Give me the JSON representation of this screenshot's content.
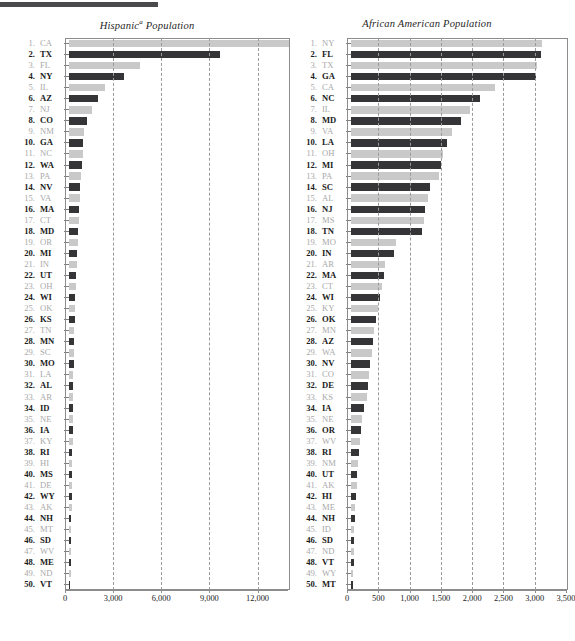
{
  "document": {
    "top_rule_color": "#4a4a4c"
  },
  "colors": {
    "bar_dark": "#353537",
    "bar_light": "#c9c9c9",
    "label_dark": "#1b1b1b",
    "label_light": "#a9a9a9",
    "gridline": "#9a9a9a",
    "frame": "#8c8c8c"
  },
  "chart_data": [
    {
      "id": "hispanic",
      "type": "bar",
      "orientation": "horizontal",
      "title": "Hispanic* Population",
      "title_main": "Hispanic",
      "title_sup": "a",
      "title_tail": " Population",
      "xlabel": "",
      "ylabel": "",
      "xlim": [
        0,
        13900
      ],
      "grid": true,
      "legend": "none",
      "ticks": [
        0,
        3000,
        6000,
        9000,
        12000
      ],
      "tick_labels": [
        "0",
        "3,000",
        "6,000",
        "9,000",
        "12,000"
      ],
      "categories": [
        "CA",
        "TX",
        "FL",
        "NY",
        "IL",
        "AZ",
        "NJ",
        "CO",
        "NM",
        "GA",
        "NC",
        "WA",
        "PA",
        "NV",
        "VA",
        "MA",
        "CT",
        "MD",
        "OR",
        "MI",
        "IN",
        "UT",
        "OH",
        "WI",
        "OK",
        "KS",
        "TN",
        "MN",
        "SC",
        "MO",
        "LA",
        "AL",
        "AR",
        "ID",
        "NE",
        "IA",
        "KY",
        "RI",
        "HI",
        "MS",
        "DE",
        "WY",
        "AK",
        "NH",
        "MT",
        "SD",
        "WV",
        "ME",
        "ND",
        "VT"
      ],
      "ranks": [
        1,
        2,
        3,
        4,
        5,
        6,
        7,
        8,
        9,
        10,
        11,
        12,
        13,
        14,
        15,
        16,
        17,
        18,
        19,
        20,
        21,
        22,
        23,
        24,
        25,
        26,
        27,
        28,
        29,
        30,
        31,
        32,
        33,
        34,
        35,
        36,
        37,
        38,
        39,
        40,
        41,
        42,
        43,
        44,
        45,
        46,
        47,
        48,
        49,
        50
      ],
      "values": [
        13800,
        9400,
        4400,
        3450,
        2250,
        1800,
        1450,
        1150,
        930,
        890,
        860,
        800,
        760,
        700,
        680,
        650,
        600,
        570,
        540,
        520,
        480,
        450,
        420,
        400,
        380,
        360,
        340,
        320,
        300,
        290,
        280,
        270,
        260,
        250,
        240,
        230,
        220,
        210,
        200,
        190,
        180,
        170,
        160,
        150,
        140,
        130,
        120,
        110,
        100,
        90
      ]
    },
    {
      "id": "african-american",
      "type": "bar",
      "orientation": "horizontal",
      "title": "African American Population",
      "title_main": "African American Population",
      "xlabel": "",
      "ylabel": "",
      "xlim": [
        0,
        3500
      ],
      "grid": true,
      "legend": "none",
      "ticks": [
        0,
        500,
        1000,
        1500,
        2000,
        2500,
        3000,
        3500
      ],
      "tick_labels": [
        "0",
        "500",
        "1,000",
        "1,500",
        "2,000",
        "2,500",
        "3,000",
        "3,500"
      ],
      "categories": [
        "NY",
        "FL",
        "TX",
        "GA",
        "CA",
        "NC",
        "IL",
        "MD",
        "VA",
        "LA",
        "OH",
        "MI",
        "PA",
        "SC",
        "AL",
        "NJ",
        "MS",
        "TN",
        "MO",
        "IN",
        "AR",
        "MA",
        "CT",
        "WI",
        "KY",
        "OK",
        "MN",
        "AZ",
        "WA",
        "NV",
        "CO",
        "DE",
        "KS",
        "IA",
        "NE",
        "OR",
        "WV",
        "RI",
        "NM",
        "UT",
        "AK",
        "HI",
        "ME",
        "NH",
        "ID",
        "SD",
        "ND",
        "VT",
        "WY",
        "MT"
      ],
      "ranks": [
        1,
        2,
        3,
        4,
        5,
        6,
        7,
        8,
        9,
        10,
        11,
        12,
        13,
        14,
        15,
        16,
        17,
        18,
        19,
        20,
        21,
        22,
        23,
        24,
        25,
        26,
        27,
        28,
        29,
        30,
        31,
        32,
        33,
        34,
        35,
        36,
        37,
        38,
        39,
        40,
        41,
        42,
        43,
        44,
        45,
        46,
        47,
        48,
        49,
        50
      ],
      "values": [
        3060,
        3040,
        2980,
        2960,
        2300,
        2060,
        1900,
        1760,
        1620,
        1540,
        1470,
        1440,
        1410,
        1270,
        1230,
        1190,
        1160,
        1130,
        720,
        690,
        540,
        520,
        500,
        470,
        430,
        400,
        370,
        350,
        330,
        300,
        290,
        270,
        250,
        200,
        180,
        160,
        140,
        120,
        110,
        100,
        90,
        80,
        70,
        60,
        55,
        50,
        45,
        40,
        35,
        30
      ]
    }
  ],
  "footnote": ""
}
